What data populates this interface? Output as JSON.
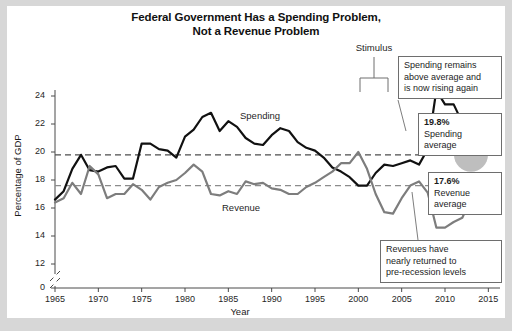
{
  "title": {
    "line1": "Federal Government Has a Spending Problem,",
    "line2": "Not a Revenue Problem"
  },
  "annotations": {
    "stimulus": "Stimulus",
    "spending_remains": {
      "l1": "Spending remains",
      "l2": "above average and",
      "l3": "is now rising again"
    },
    "spending_average": {
      "pct": "19.8%",
      "l1": "Spending",
      "l2": "average"
    },
    "revenue_average": {
      "pct": "17.6%",
      "l1": "Revenue",
      "l2": "average"
    },
    "revenues_returned": {
      "l1": "Revenues have",
      "l2": "nearly returned to",
      "l3": "pre-recession levels"
    }
  },
  "chart_data": {
    "type": "line",
    "title": "Federal Government Has a Spending Problem, Not a Revenue Problem",
    "xlabel": "Year",
    "ylabel": "Percentage of GDP",
    "xlim": [
      1965,
      2016
    ],
    "ylim": [
      11,
      25
    ],
    "y_axis_break": true,
    "y_axis_zero_label": "0",
    "grid": false,
    "legend": "inline-labels",
    "xticks": [
      1965,
      1970,
      1975,
      1980,
      1985,
      1990,
      1995,
      2000,
      2005,
      2010,
      2015
    ],
    "yticks": [
      0,
      12,
      14,
      16,
      18,
      20,
      22,
      24
    ],
    "reference_lines": [
      {
        "name": "Spending average",
        "value": 19.8,
        "color": "#4d4d4d",
        "style": "dashed"
      },
      {
        "name": "Revenue average",
        "value": 17.6,
        "color": "#8c8c8c",
        "style": "dashed"
      }
    ],
    "markers": [
      {
        "series": "Spending",
        "x": 2013,
        "y": 19.8,
        "shape": "circle",
        "color": "#b3b3b3",
        "radius": 17
      },
      {
        "series": "Revenue",
        "x": 2014,
        "y": 17.6,
        "shape": "circle",
        "color": "#b3b3b3",
        "radius": 8
      }
    ],
    "x": [
      1965,
      1966,
      1967,
      1968,
      1969,
      1970,
      1971,
      1972,
      1973,
      1974,
      1975,
      1976,
      1977,
      1978,
      1979,
      1980,
      1981,
      1982,
      1983,
      1984,
      1985,
      1986,
      1987,
      1988,
      1989,
      1990,
      1991,
      1992,
      1993,
      1994,
      1995,
      1996,
      1997,
      1998,
      1999,
      2000,
      2001,
      2002,
      2003,
      2004,
      2005,
      2006,
      2007,
      2008,
      2009,
      2010,
      2011,
      2012,
      2013,
      2014,
      2015
    ],
    "series": [
      {
        "name": "Spending",
        "color": "#111111",
        "values": [
          16.6,
          17.2,
          18.8,
          19.8,
          18.7,
          18.6,
          18.9,
          19.0,
          18.1,
          18.1,
          20.6,
          20.6,
          20.2,
          20.1,
          19.6,
          21.1,
          21.6,
          22.5,
          22.8,
          21.5,
          22.2,
          21.8,
          21.0,
          20.6,
          20.5,
          21.2,
          21.7,
          21.5,
          20.7,
          20.3,
          20.1,
          19.6,
          18.9,
          18.6,
          18.2,
          17.6,
          17.6,
          18.5,
          19.1,
          19.0,
          19.2,
          19.4,
          19.1,
          20.2,
          24.4,
          23.4,
          23.4,
          22.1,
          20.8,
          20.3,
          20.9
        ],
        "style": "solid",
        "width": 2.2
      },
      {
        "name": "Revenue",
        "color": "#7d7d7d",
        "values": [
          16.4,
          16.7,
          17.8,
          17.0,
          19.0,
          18.4,
          16.7,
          17.0,
          17.0,
          17.7,
          17.3,
          16.6,
          17.5,
          17.8,
          18.0,
          18.5,
          19.1,
          18.6,
          17.0,
          16.9,
          17.2,
          17.0,
          17.9,
          17.7,
          17.8,
          17.4,
          17.3,
          17.0,
          17.0,
          17.5,
          17.8,
          18.2,
          18.6,
          19.2,
          19.2,
          20.0,
          18.8,
          17.0,
          15.7,
          15.6,
          16.7,
          17.6,
          17.9,
          17.1,
          14.6,
          14.6,
          15.0,
          15.3,
          16.7,
          17.5,
          17.7
        ],
        "style": "solid",
        "width": 2.2
      }
    ],
    "series_inline_labels": [
      {
        "name": "Spending",
        "x": 240,
        "y": 110
      },
      {
        "name": "Revenue",
        "x": 222,
        "y": 202
      }
    ]
  }
}
